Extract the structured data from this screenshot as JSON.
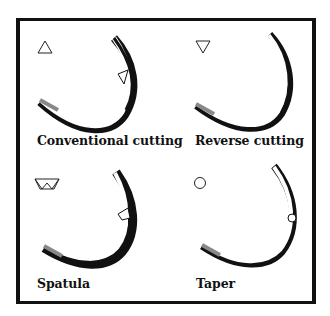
{
  "panels": [
    {
      "label": "Conventional cutting",
      "cross_section": "triangle-up"
    },
    {
      "label": "Reverse cutting",
      "cross_section": "triangle-down"
    },
    {
      "label": "Spatula",
      "cross_section": "trapezoid"
    },
    {
      "label": "Taper",
      "cross_section": "circle"
    }
  ],
  "colors": {
    "line": "#111111",
    "background": "#ffffff"
  }
}
